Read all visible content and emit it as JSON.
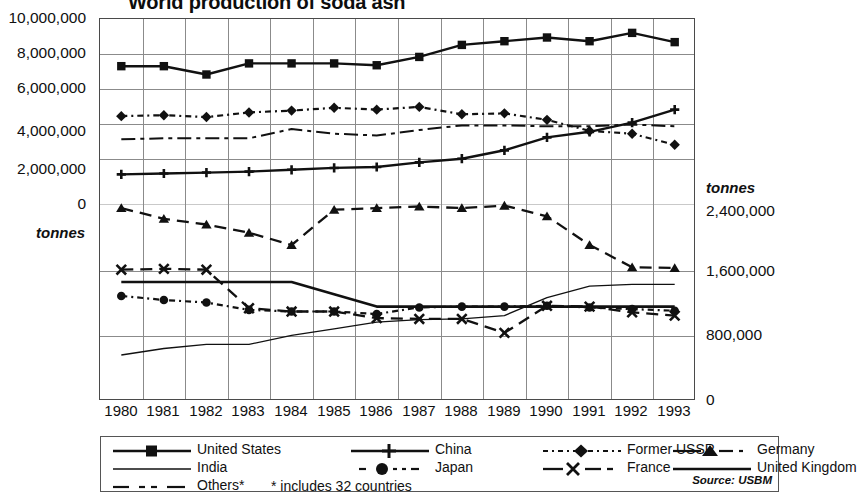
{
  "title": "World production of soda ash",
  "source_note": "Source: USBM",
  "axes": {
    "left_unit": "tonnes",
    "right_unit": "tonnes",
    "left_ticks": [
      "10,000,000",
      "8,000,000",
      "6,000,000",
      "4,000,000",
      "2,000,000",
      "0"
    ],
    "right_ticks": [
      "2,400,000",
      "1,600,000",
      "800,000",
      "0"
    ],
    "x_ticks": [
      "1980",
      "1981",
      "1982",
      "1983",
      "1984",
      "1985",
      "1986",
      "1987",
      "1988",
      "1989",
      "1990",
      "1991",
      "1992",
      "1993"
    ]
  },
  "legend": {
    "entries": [
      {
        "label": "United States",
        "key": "solid-square"
      },
      {
        "label": "China",
        "key": "solid-plus"
      },
      {
        "label": "Former USSR",
        "key": "dotted-diamond"
      },
      {
        "label": "Germany",
        "key": "dashed-triangle"
      },
      {
        "label": "India",
        "key": "thin-solid"
      },
      {
        "label": "Japan",
        "key": "dotted-circle"
      },
      {
        "label": "France",
        "key": "dashed-cross"
      },
      {
        "label": "United Kingdom",
        "key": "thick-solid"
      },
      {
        "label": "Others*",
        "key": "dash-dot"
      }
    ],
    "footnote": "*  includes 32 countries"
  },
  "chart_data": {
    "type": "line",
    "title": "World production of soda ash",
    "xlabel": "",
    "ylabel": "tonnes",
    "grid": true,
    "legend_position": "bottom",
    "x": [
      1980,
      1981,
      1982,
      1983,
      1984,
      1985,
      1986,
      1987,
      1988,
      1989,
      1990,
      1991,
      1992,
      1993
    ],
    "left_axis": {
      "label": "tonnes",
      "range": [
        0,
        10000000
      ],
      "ticks": [
        0,
        2000000,
        4000000,
        6000000,
        8000000,
        10000000
      ]
    },
    "right_axis": {
      "label": "tonnes",
      "range": [
        0,
        2400000
      ],
      "ticks": [
        0,
        800000,
        1600000,
        2400000
      ]
    },
    "series": [
      {
        "name": "United States",
        "axis": "left",
        "marker": "square",
        "line": "solid",
        "values": [
          7450000,
          7450000,
          7000000,
          7600000,
          7600000,
          7600000,
          7500000,
          7950000,
          8600000,
          8800000,
          9000000,
          8800000,
          9250000,
          8750000
        ]
      },
      {
        "name": "China",
        "axis": "left",
        "marker": "plus",
        "line": "solid",
        "values": [
          1600000,
          1650000,
          1700000,
          1750000,
          1850000,
          1950000,
          2000000,
          2250000,
          2450000,
          2900000,
          3600000,
          3900000,
          4400000,
          5100000
        ]
      },
      {
        "name": "Former USSR",
        "axis": "left",
        "marker": "diamond",
        "line": "dotted",
        "values": [
          4750000,
          4800000,
          4700000,
          4950000,
          5050000,
          5200000,
          5100000,
          5250000,
          4850000,
          4900000,
          4550000,
          3950000,
          3800000,
          3200000
        ]
      },
      {
        "name": "Others*",
        "axis": "left",
        "marker": "none",
        "line": "dash-dot",
        "values": [
          3500000,
          3550000,
          3550000,
          3550000,
          4050000,
          3800000,
          3700000,
          4000000,
          4250000,
          4250000,
          4200000,
          4200000,
          4300000,
          4200000
        ]
      },
      {
        "name": "Germany",
        "axis": "right",
        "marker": "triangle",
        "line": "dashed",
        "values": [
          2350000,
          2220000,
          2150000,
          2050000,
          1900000,
          2330000,
          2350000,
          2370000,
          2350000,
          2380000,
          2250000,
          1900000,
          1630000,
          1620000
        ]
      },
      {
        "name": "United Kingdom",
        "axis": "right",
        "marker": "none",
        "line": "thick-solid",
        "values": [
          1450000,
          1450000,
          1450000,
          1450000,
          1450000,
          1300000,
          1150000,
          1150000,
          1150000,
          1150000,
          1150000,
          1150000,
          1150000,
          1150000
        ]
      },
      {
        "name": "Japan",
        "axis": "right",
        "marker": "circle",
        "line": "dotted",
        "values": [
          1280000,
          1230000,
          1200000,
          1110000,
          1090000,
          1090000,
          1060000,
          1140000,
          1150000,
          1150000,
          1160000,
          1140000,
          1120000,
          1100000
        ]
      },
      {
        "name": "France",
        "axis": "right",
        "marker": "cross",
        "line": "dashed",
        "values": [
          1600000,
          1610000,
          1600000,
          1130000,
          1090000,
          1090000,
          1010000,
          1000000,
          1000000,
          830000,
          1160000,
          1150000,
          1080000,
          1040000
        ]
      },
      {
        "name": "India",
        "axis": "right",
        "marker": "none",
        "line": "thin-solid",
        "values": [
          560000,
          640000,
          690000,
          690000,
          800000,
          880000,
          960000,
          990000,
          1000000,
          1040000,
          1260000,
          1400000,
          1420000,
          1420000
        ]
      }
    ]
  }
}
